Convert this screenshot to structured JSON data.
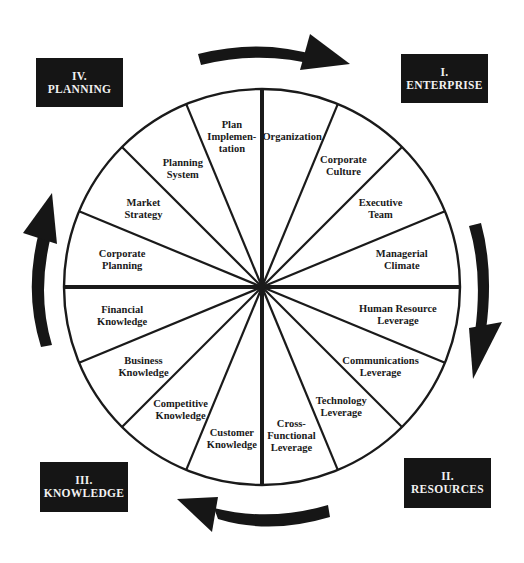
{
  "diagram": {
    "type": "wheel",
    "segment_count": 16,
    "colors": {
      "ink": "#1a1a1a",
      "box_fill": "#151515",
      "box_text": "#f2f2f2",
      "background": "#ffffff"
    },
    "quadrant_boxes": [
      {
        "id": "enterprise",
        "numeral": "I.",
        "label": "ENTERPRISE"
      },
      {
        "id": "resources",
        "numeral": "II.",
        "label": "RESOURCES"
      },
      {
        "id": "knowledge",
        "numeral": "III.",
        "label": "KNOWLEDGE"
      },
      {
        "id": "planning",
        "numeral": "IV.",
        "label": "PLANNING"
      }
    ],
    "segments": [
      {
        "quadrant": "enterprise",
        "lines": [
          "Organization"
        ]
      },
      {
        "quadrant": "enterprise",
        "lines": [
          "Corporate",
          "Culture"
        ]
      },
      {
        "quadrant": "enterprise",
        "lines": [
          "Executive",
          "Team"
        ]
      },
      {
        "quadrant": "enterprise",
        "lines": [
          "Managerial",
          "Climate"
        ]
      },
      {
        "quadrant": "resources",
        "lines": [
          "Human Resource",
          "Leverage"
        ]
      },
      {
        "quadrant": "resources",
        "lines": [
          "Communications",
          "Leverage"
        ]
      },
      {
        "quadrant": "resources",
        "lines": [
          "Technology",
          "Leverage"
        ]
      },
      {
        "quadrant": "resources",
        "lines": [
          "Cross-",
          "Functional",
          "Leverage"
        ]
      },
      {
        "quadrant": "knowledge",
        "lines": [
          "Customer",
          "Knowledge"
        ]
      },
      {
        "quadrant": "knowledge",
        "lines": [
          "Competitive",
          "Knowledge"
        ]
      },
      {
        "quadrant": "knowledge",
        "lines": [
          "Business",
          "Knowledge"
        ]
      },
      {
        "quadrant": "knowledge",
        "lines": [
          "Financial",
          "Knowledge"
        ]
      },
      {
        "quadrant": "planning",
        "lines": [
          "Corporate",
          "Planning"
        ]
      },
      {
        "quadrant": "planning",
        "lines": [
          "Market",
          "Strategy"
        ]
      },
      {
        "quadrant": "planning",
        "lines": [
          "Planning",
          "System"
        ]
      },
      {
        "quadrant": "planning",
        "lines": [
          "Plan",
          "Implemen-",
          "tation"
        ]
      }
    ],
    "flow_direction": "clockwise",
    "arrows": [
      {
        "name": "arrow-planning-to-enterprise",
        "from": "planning",
        "to": "enterprise"
      },
      {
        "name": "arrow-enterprise-to-resources",
        "from": "enterprise",
        "to": "resources"
      },
      {
        "name": "arrow-resources-to-knowledge",
        "from": "resources",
        "to": "knowledge"
      },
      {
        "name": "arrow-knowledge-to-planning",
        "from": "knowledge",
        "to": "planning"
      }
    ]
  }
}
